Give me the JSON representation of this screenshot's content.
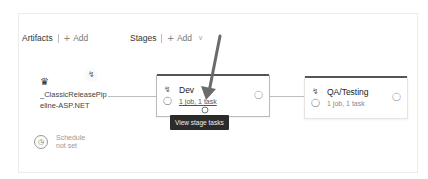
{
  "artifacts_header": {
    "label": "Artifacts",
    "add_label": "Add"
  },
  "stages_header": {
    "label": "Stages",
    "add_label": "Add"
  },
  "artifact": {
    "name": "_ClassicReleasePipeline-ASP.NET",
    "name_line1": "_ClassicReleasePip",
    "name_line2": "eline-ASP.NET",
    "icon": "build-artifact-icon",
    "trigger_icon": "lightning-trigger-icon"
  },
  "schedule": {
    "line1": "Schedule",
    "line2": "not set",
    "icon": "clock-icon"
  },
  "stages": [
    {
      "name": "Dev",
      "summary": "1 job, 1 task",
      "pre_icons": [
        "pre-deployment-conditions-icon",
        "pre-deployment-approvers-icon"
      ],
      "post_icon": "post-deployment-approvers-icon"
    },
    {
      "name": "QA/Testing",
      "summary": "1 job, 1 task",
      "pre_icons": [
        "pre-deployment-conditions-icon",
        "pre-deployment-approvers-icon"
      ],
      "post_icon": "post-deployment-approvers-icon"
    }
  ],
  "tooltip": {
    "text": "View stage tasks"
  },
  "colors": {
    "annotation_arrow": "#6b6b6b",
    "tooltip_bg": "#2b2b2b",
    "stage_topbar": "#555555"
  }
}
